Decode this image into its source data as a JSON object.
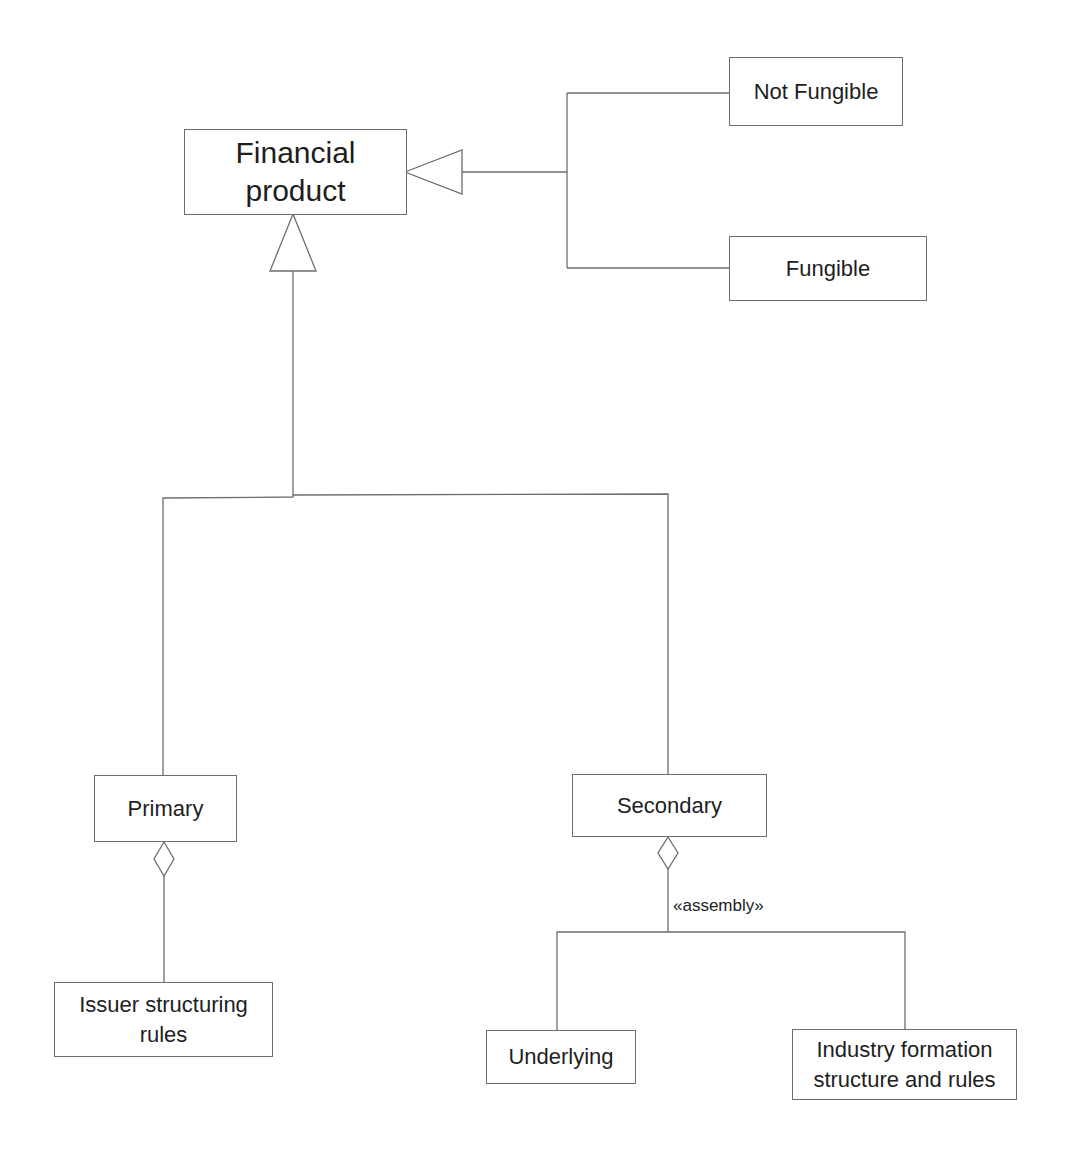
{
  "diagram": {
    "type": "UML class diagram",
    "line_color": "#6e6e6e",
    "nodes": [
      {
        "id": "financial_product",
        "label": "Financial\nproduct"
      },
      {
        "id": "not_fungible",
        "label": "Not Fungible"
      },
      {
        "id": "fungible",
        "label": "Fungible"
      },
      {
        "id": "primary",
        "label": "Primary"
      },
      {
        "id": "secondary",
        "label": "Secondary"
      },
      {
        "id": "issuer_rules",
        "label": "Issuer structuring\nrules"
      },
      {
        "id": "underlying",
        "label": "Underlying"
      },
      {
        "id": "industry_rules",
        "label": "Industry formation\nstructure  and rules"
      }
    ],
    "edges": [
      {
        "from": "not_fungible",
        "to": "financial_product",
        "kind": "generalization"
      },
      {
        "from": "fungible",
        "to": "financial_product",
        "kind": "generalization"
      },
      {
        "from": "primary",
        "to": "financial_product",
        "kind": "generalization"
      },
      {
        "from": "secondary",
        "to": "financial_product",
        "kind": "generalization"
      },
      {
        "from": "issuer_rules",
        "to": "primary",
        "kind": "aggregation"
      },
      {
        "from": "underlying",
        "to": "secondary",
        "kind": "aggregation",
        "stereotype": "«assembly»"
      },
      {
        "from": "industry_rules",
        "to": "secondary",
        "kind": "aggregation",
        "stereotype": "«assembly»"
      }
    ],
    "stereotype_label": "«assembly»"
  }
}
